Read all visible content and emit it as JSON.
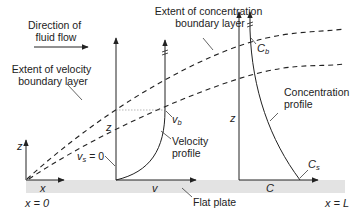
{
  "diagram": {
    "title_labels": {
      "flow_direction": [
        "Direction of",
        "fluid flow"
      ],
      "concentration_layer": [
        "Extent of concentration",
        "boundary layer"
      ],
      "velocity_layer": [
        "Extent of velocity",
        "boundary layer"
      ],
      "velocity_profile": [
        "Velocity",
        "profile"
      ],
      "concentration_profile": [
        "Concentration",
        "profile"
      ],
      "flat_plate": "Flat plate"
    },
    "axes": {
      "origin_z": "z",
      "origin_x": "x",
      "velocity_z": "z",
      "velocity_v": "v",
      "concentration_z": "z",
      "concentration_c": "C"
    },
    "symbols": {
      "v_s_main": "v",
      "v_s_sub": "s",
      "v_s_eq": " = 0",
      "v_b_main": "v",
      "v_b_sub": "b",
      "c_b_main": "C",
      "c_b_sub": "b",
      "c_s_main": "C",
      "c_s_sub": "s"
    },
    "positions": {
      "start": "x = 0",
      "end": "x = L"
    },
    "colors": {
      "line": "#222222",
      "plate": "#e3e3e3",
      "guide": "#888888"
    }
  }
}
